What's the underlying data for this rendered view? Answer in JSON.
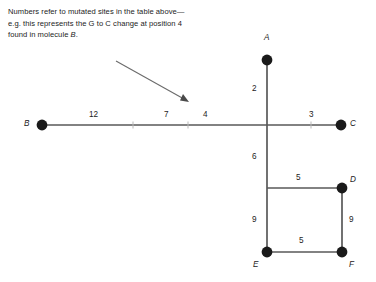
{
  "caption": {
    "line1": "Numbers refer to mutated sites in the",
    "line2_a": "table above—e.g. this represents the G",
    "line3_a": "to C change at position 4 found in",
    "line4_a": "molecule ",
    "line4_ital": "B",
    "line4_b": "."
  },
  "colors": {
    "background": "#ffffff",
    "line": "#595959",
    "node": "#1a1a1a",
    "text": "#1c1c1c",
    "arrow": "#6b6b6b"
  },
  "diagram": {
    "type": "unrooted-network",
    "nodes": [
      {
        "id": "A",
        "label": "A",
        "x": 267,
        "y": 60,
        "label_x": 264,
        "label_y": 40
      },
      {
        "id": "B",
        "label": "B",
        "x": 42,
        "y": 125,
        "label_x": 25,
        "label_y": 119
      },
      {
        "id": "C",
        "label": "C",
        "x": 341,
        "y": 125,
        "label_x": 350,
        "label_y": 119
      },
      {
        "id": "D",
        "label": "D",
        "x": 342,
        "y": 188,
        "label_x": 350,
        "label_y": 175
      },
      {
        "id": "E",
        "label": "E",
        "x": 267,
        "y": 252,
        "label_x": 254,
        "label_y": 262
      },
      {
        "id": "F",
        "label": "F",
        "x": 342,
        "y": 252,
        "label_x": 349,
        "label_y": 262
      }
    ],
    "edges": [
      {
        "id": "B-junction-1",
        "label": "12",
        "label_x": 92,
        "label_y": 111
      },
      {
        "id": "junction-1-2",
        "label": "7",
        "label_x": 165,
        "label_y": 111
      },
      {
        "id": "junction-2-center",
        "label": "4",
        "label_x": 205,
        "label_y": 111
      },
      {
        "id": "center-C",
        "label": "3",
        "label_x": 311,
        "label_y": 111
      },
      {
        "id": "A-center",
        "label": "2",
        "label_x": 253,
        "label_y": 85
      },
      {
        "id": "center-EDjunction",
        "label": "6",
        "label_x": 253,
        "label_y": 152
      },
      {
        "id": "Djunction-D",
        "label": "5",
        "label_x": 297,
        "label_y": 173
      },
      {
        "id": "Djunction-E",
        "label": "9",
        "label_x": 253,
        "label_y": 215
      },
      {
        "id": "D-F",
        "label": "9",
        "label_x": 349,
        "label_y": 215
      },
      {
        "id": "E-F",
        "label": "5",
        "label_x": 300,
        "label_y": 237
      }
    ],
    "annotation_arrow": {
      "name": "caption-pointer-arrow",
      "from_x": 116,
      "from_y": 61,
      "to_x": 188,
      "to_y": 102
    }
  }
}
